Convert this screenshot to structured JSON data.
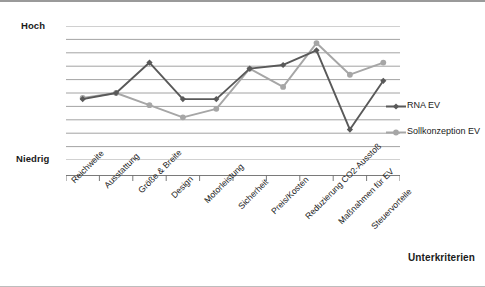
{
  "axis": {
    "y_high_label": "Hoch",
    "y_low_label": "Niedrig",
    "x_title": "Unterkriterien"
  },
  "legend": {
    "items": [
      {
        "label": "RNA EV",
        "color": "#595959"
      },
      {
        "label": "Sollkonzeption EV",
        "color": "#a6a6a6"
      }
    ]
  },
  "chart_data": {
    "type": "line",
    "title": "",
    "subtitle": "",
    "xlabel": "Unterkriterien",
    "ylabel": "",
    "ylim": [
      0,
      11
    ],
    "grid": true,
    "grid_lines": 11,
    "legend_position": "right",
    "y_tick_labels": [
      "Niedrig",
      "Hoch"
    ],
    "categories": [
      "Reichweite",
      "Ausstattung",
      "Größe & Breite",
      "Design",
      "Motorleistung",
      "Sicherheit",
      "Preis/Kosten",
      "Reduzierung CO2-Ausstoß",
      "Maßnahmen für EV",
      "Steuervorteile"
    ],
    "series": [
      {
        "name": "RNA EV",
        "color": "#595959",
        "marker": "diamond",
        "values": [
          5.0,
          5.5,
          8.0,
          5.0,
          5.0,
          7.5,
          7.8,
          9.0,
          2.5,
          6.5
        ]
      },
      {
        "name": "Sollkonzeption EV",
        "color": "#a6a6a6",
        "marker": "circle",
        "values": [
          5.1,
          5.5,
          4.5,
          3.5,
          4.2,
          7.5,
          6.0,
          9.6,
          7.0,
          8.0
        ]
      }
    ]
  }
}
